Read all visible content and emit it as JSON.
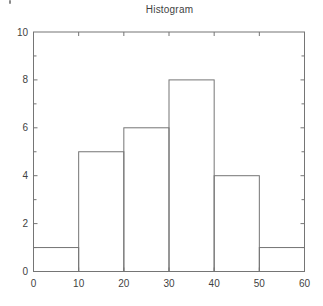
{
  "chart_data": {
    "type": "bar",
    "subtype": "histogram",
    "title": "Histogram",
    "bin_edges": [
      0,
      10,
      20,
      30,
      40,
      50,
      60
    ],
    "values": [
      1,
      5,
      6,
      8,
      4,
      1
    ],
    "xlabel": "",
    "ylabel": "",
    "xlim": [
      0,
      60
    ],
    "ylim": [
      0,
      10
    ],
    "xticks": [
      0,
      10,
      20,
      30,
      40,
      50,
      60
    ],
    "yticks": [
      0,
      2,
      4,
      6,
      8,
      10
    ],
    "y_minor_ticks": [
      1,
      3,
      5,
      7,
      9
    ],
    "bar_style": "outlined, unfilled",
    "grid": false,
    "legend": false,
    "box": true
  },
  "colors": {
    "line": "#757575",
    "text": "#3f3f3f",
    "background": "#ffffff"
  }
}
